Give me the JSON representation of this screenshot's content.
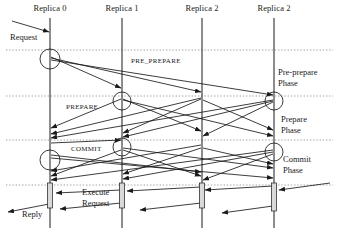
{
  "diagram": {
    "background_color": "#ffffff",
    "line_color": "#1a1a1a",
    "divider_color": "#888888",
    "activation_fill": "#d9d9d9",
    "participants": [
      {
        "label": "Replica 0",
        "x": 50
      },
      {
        "label": "Replica 1",
        "x": 122
      },
      {
        "label": "Replica 2",
        "x": 202
      },
      {
        "label": "Replica 2",
        "x": 274
      }
    ],
    "message_labels": [
      {
        "text": "PRE_PREPARE",
        "x": 131,
        "y": 58
      },
      {
        "text": "PREPARE",
        "x": 66,
        "y": 104
      },
      {
        "text": "COMMIT",
        "x": 71,
        "y": 146
      }
    ],
    "phase_labels": [
      {
        "text": "Pre-prepare",
        "x": 278,
        "y": 68
      },
      {
        "text": "Phase",
        "x": 278,
        "y": 79
      },
      {
        "text": "Prepare",
        "x": 281,
        "y": 115
      },
      {
        "text": "Phase",
        "x": 281,
        "y": 126
      },
      {
        "text": "Commit",
        "x": 283,
        "y": 155
      },
      {
        "text": "Phase",
        "x": 283,
        "y": 166
      }
    ],
    "side_labels": [
      {
        "text": "Request",
        "x": 10,
        "y": 33
      },
      {
        "text": "Execute",
        "x": 82,
        "y": 188
      },
      {
        "text": "Request",
        "x": 82,
        "y": 199
      },
      {
        "text": "Reply",
        "x": 22,
        "y": 210
      }
    ],
    "phase_dividers": [
      50,
      96,
      140,
      185
    ],
    "activation_bars": [
      {
        "x": 50,
        "y": 183,
        "width": 5,
        "height": 25
      },
      {
        "x": 122,
        "y": 183,
        "width": 5,
        "height": 25
      },
      {
        "x": 202,
        "y": 183,
        "width": 5,
        "height": 25
      },
      {
        "x": 274,
        "y": 183,
        "width": 5,
        "height": 28
      }
    ],
    "self_loop_circles": [
      {
        "cx": 50,
        "cy": 59,
        "r": 10
      },
      {
        "cx": 122,
        "cy": 101,
        "r": 9
      },
      {
        "cx": 274,
        "cy": 101,
        "r": 9
      },
      {
        "cx": 122,
        "cy": 147,
        "r": 9
      },
      {
        "cx": 274,
        "cy": 152,
        "r": 9
      },
      {
        "cx": 50,
        "cy": 160,
        "r": 10
      }
    ],
    "arrows": [
      {
        "name": "client-request",
        "x1": 12,
        "y1": 21,
        "x2": 49,
        "y2": 32
      },
      {
        "name": "preprepare-r0-r1",
        "x1": 51,
        "y1": 57,
        "x2": 121,
        "y2": 88
      },
      {
        "name": "preprepare-r0-r2",
        "x1": 51,
        "y1": 58,
        "x2": 201,
        "y2": 92
      },
      {
        "name": "preprepare-r0-r3",
        "x1": 51,
        "y1": 60,
        "x2": 273,
        "y2": 95
      },
      {
        "name": "prepare-r1-r0",
        "x1": 121,
        "y1": 99,
        "x2": 51,
        "y2": 128
      },
      {
        "name": "prepare-r1-r2",
        "x1": 123,
        "y1": 99,
        "x2": 201,
        "y2": 131
      },
      {
        "name": "prepare-r1-r3",
        "x1": 123,
        "y1": 100,
        "x2": 273,
        "y2": 136
      },
      {
        "name": "prepare-r2-r0",
        "x1": 201,
        "y1": 98,
        "x2": 51,
        "y2": 134
      },
      {
        "name": "prepare-r2-r1",
        "x1": 201,
        "y1": 99,
        "x2": 123,
        "y2": 133
      },
      {
        "name": "prepare-r2-r3",
        "x1": 203,
        "y1": 100,
        "x2": 273,
        "y2": 130
      },
      {
        "name": "prepare-r3-r0",
        "x1": 273,
        "y1": 100,
        "x2": 51,
        "y2": 138
      },
      {
        "name": "prepare-r3-r1",
        "x1": 273,
        "y1": 101,
        "x2": 123,
        "y2": 137
      },
      {
        "name": "prepare-r3-r2",
        "x1": 273,
        "y1": 102,
        "x2": 203,
        "y2": 136
      },
      {
        "name": "commit-r0-r1",
        "x1": 51,
        "y1": 143,
        "x2": 121,
        "y2": 140
      },
      {
        "name": "commit-r0-r2",
        "x1": 51,
        "y1": 155,
        "x2": 201,
        "y2": 172
      },
      {
        "name": "commit-r0-r3",
        "x1": 51,
        "y1": 158,
        "x2": 273,
        "y2": 178
      },
      {
        "name": "commit-r1-r0",
        "x1": 121,
        "y1": 150,
        "x2": 51,
        "y2": 176
      },
      {
        "name": "commit-r1-r2",
        "x1": 123,
        "y1": 150,
        "x2": 201,
        "y2": 176
      },
      {
        "name": "commit-r1-r3",
        "x1": 123,
        "y1": 148,
        "x2": 273,
        "y2": 168
      },
      {
        "name": "commit-r2-r0",
        "x1": 201,
        "y1": 145,
        "x2": 51,
        "y2": 171
      },
      {
        "name": "commit-r2-r1",
        "x1": 201,
        "y1": 148,
        "x2": 123,
        "y2": 174
      },
      {
        "name": "commit-r2-r3",
        "x1": 203,
        "y1": 148,
        "x2": 273,
        "y2": 164
      },
      {
        "name": "commit-r3-r0",
        "x1": 273,
        "y1": 150,
        "x2": 51,
        "y2": 180
      },
      {
        "name": "commit-r3-r1",
        "x1": 273,
        "y1": 152,
        "x2": 123,
        "y2": 179
      },
      {
        "name": "commit-r3-r2",
        "x1": 273,
        "y1": 154,
        "x2": 203,
        "y2": 180
      },
      {
        "name": "reply-r3-r2",
        "x1": 273,
        "y1": 186,
        "x2": 205,
        "y2": 190
      },
      {
        "name": "reply-r2-r1",
        "x1": 201,
        "y1": 187,
        "x2": 127,
        "y2": 191
      },
      {
        "name": "reply-r1-r0",
        "x1": 121,
        "y1": 190,
        "x2": 56,
        "y2": 193
      },
      {
        "name": "reply-client-r0",
        "x1": 49,
        "y1": 204,
        "x2": 8,
        "y2": 212
      },
      {
        "name": "reply-client-r1",
        "x1": 121,
        "y1": 203,
        "x2": 60,
        "y2": 209
      },
      {
        "name": "reply-client-r2",
        "x1": 201,
        "y1": 203,
        "x2": 140,
        "y2": 210
      },
      {
        "name": "reply-client-r3",
        "x1": 273,
        "y1": 206,
        "x2": 222,
        "y2": 213
      },
      {
        "name": "reply-tail-r3-right",
        "x1": 330,
        "y1": 183,
        "x2": 279,
        "y2": 190
      }
    ]
  }
}
